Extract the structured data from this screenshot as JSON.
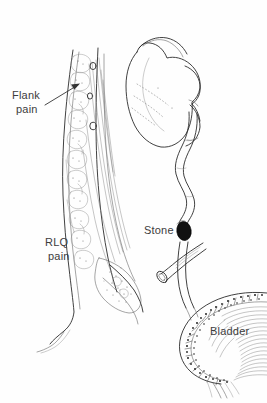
{
  "figure": {
    "background_color": "#fefefe",
    "ink_color": "#2b2b2b",
    "label_color": "#3d3d3d",
    "stone_color": "#111111",
    "width": 267,
    "height": 403
  },
  "labels": {
    "flank_pain_line1": "Flank",
    "flank_pain_line2": "pain",
    "rlq_pain_line1": "RLQ",
    "rlq_pain_line2": "pain",
    "stone": "Stone",
    "bladder": "Bladder"
  },
  "structures": {
    "kidney": "kidney",
    "renal_pelvis": "renal-pelvis",
    "ureter": "ureter",
    "stone": "ureteral-stone",
    "bladder": "bladder",
    "spine": "vertebral-column",
    "psoas": "psoas-muscle",
    "cut_vessel": "transected-vessel-stub"
  },
  "annotations": {
    "flank_arrow": "arrow pointing from Flank pain label to flank region",
    "stone_location": "distal ureter",
    "kidney_side": "right"
  }
}
